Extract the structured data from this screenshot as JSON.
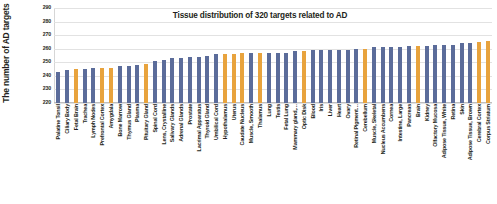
{
  "chart_data": {
    "type": "bar",
    "title": "Tissue distribution of 320 targets related to AD",
    "xlabel": "",
    "ylabel": "The number of AD targets",
    "ylim": [
      220,
      290
    ],
    "yticks": [
      220,
      230,
      240,
      250,
      260,
      270,
      280,
      290
    ],
    "grid": true,
    "legend": "none",
    "colors": {
      "primary": "#5b6c9a",
      "highlight": "#e8a33d",
      "grid": "#e2e2e2",
      "text": "#231f20"
    },
    "categories": [
      "Palatine Tonsil",
      "Ciliary Body",
      "Fetal Brain",
      "Trachea",
      "Lymph Nodes",
      "Prefrontal Cortex",
      "Amygdala",
      "Bone Marrow",
      "Thymus Gland",
      "Plasma",
      "Pituitary Gland",
      "Spinal Cord",
      "Lens, Crystalline",
      "Salivary Glands",
      "Adrenal Glands",
      "Prostate",
      "Lacrimal Apparatus",
      "Thyroid Gland",
      "Umbilical Cord",
      "Hypothalamus",
      "Uterus",
      "Caudate Nucleus",
      "Muscle, Smooth",
      "Thalamus",
      "Lung",
      "Testis",
      "Fetal Lung",
      "Mammary gland,…",
      "Optic Disk",
      "Blood",
      "Iris",
      "Liver",
      "Heart",
      "Ovary",
      "Retinal Pigment…",
      "Cerebellum",
      "Muscle, Skeletal",
      "Nucleus Accumbens",
      "Cornea",
      "Intestine, Large",
      "Pancreas",
      "Brain",
      "Kidney",
      "Olfactory Mucosa",
      "Adipose Tissue, White",
      "Retina",
      "Skin",
      "Adipose Tissue, Brown",
      "Cerebral Cortex",
      "Corpus Striatum"
    ],
    "values": [
      243,
      244,
      245,
      245,
      246,
      246,
      246,
      247,
      247,
      248,
      249,
      251,
      252,
      253,
      253,
      254,
      254,
      255,
      256,
      256,
      256,
      257,
      257,
      257,
      257,
      257,
      257,
      258,
      258,
      259,
      259,
      259,
      259,
      259,
      260,
      260,
      261,
      261,
      261,
      261,
      262,
      262,
      262,
      263,
      263,
      263,
      264,
      264,
      265,
      266
    ],
    "bar_colors": [
      "primary",
      "primary",
      "highlight",
      "primary",
      "primary",
      "highlight",
      "highlight",
      "primary",
      "primary",
      "primary",
      "highlight",
      "primary",
      "primary",
      "primary",
      "primary",
      "primary",
      "primary",
      "primary",
      "primary",
      "highlight",
      "highlight",
      "highlight",
      "primary",
      "highlight",
      "primary",
      "primary",
      "primary",
      "primary",
      "highlight",
      "primary",
      "primary",
      "primary",
      "primary",
      "primary",
      "primary",
      "highlight",
      "primary",
      "primary",
      "primary",
      "primary",
      "primary",
      "highlight",
      "primary",
      "primary",
      "primary",
      "primary",
      "primary",
      "primary",
      "highlight",
      "highlight"
    ]
  },
  "caption": {
    "text": ""
  }
}
